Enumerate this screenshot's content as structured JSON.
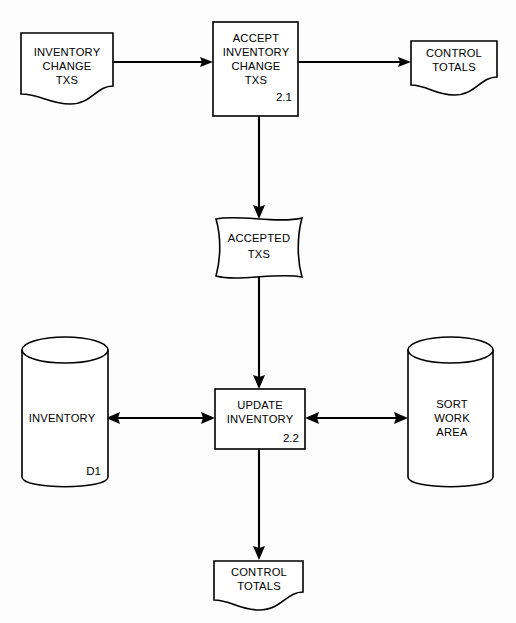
{
  "diagram": {
    "type": "data-flow-diagram",
    "background_color": "#fdfdfd",
    "line_color": "#000000",
    "fill_color": "#ffffff"
  },
  "nodes": {
    "inventory_change_txs": {
      "shape": "document",
      "line1": "INVENTORY",
      "line2": "CHANGE",
      "line3": "TXS"
    },
    "accept_process": {
      "shape": "process-box",
      "line1": "ACCEPT",
      "line2": "INVENTORY",
      "line3": "CHANGE",
      "line4": "TXS",
      "number": "2.1"
    },
    "control_totals_top": {
      "shape": "document",
      "line1": "CONTROL",
      "line2": "TOTALS"
    },
    "accepted_txs": {
      "shape": "magnetic-tape",
      "line1": "ACCEPTED",
      "line2": "TXS"
    },
    "inventory_store": {
      "shape": "cylinder",
      "line1": "INVENTORY",
      "number": "D1"
    },
    "update_process": {
      "shape": "process-box",
      "line1": "UPDATE",
      "line2": "INVENTORY",
      "number": "2.2"
    },
    "sort_work_area": {
      "shape": "cylinder",
      "line1": "SORT",
      "line2": "WORK",
      "line3": "AREA"
    },
    "control_totals_bottom": {
      "shape": "document",
      "line1": "CONTROL",
      "line2": "TOTALS"
    }
  },
  "flows": [
    {
      "name": "inventory-change-to-accept",
      "direction": "right",
      "from": "inventory_change_txs",
      "to": "accept_process"
    },
    {
      "name": "accept-to-control-totals",
      "direction": "right",
      "from": "accept_process",
      "to": "control_totals_top"
    },
    {
      "name": "accept-to-accepted-txs",
      "direction": "down",
      "from": "accept_process",
      "to": "accepted_txs"
    },
    {
      "name": "accepted-txs-to-update",
      "direction": "down",
      "from": "accepted_txs",
      "to": "update_process"
    },
    {
      "name": "inventory-store-update-bidirectional",
      "direction": "bidirectional",
      "from": "inventory_store",
      "to": "update_process"
    },
    {
      "name": "update-sort-work-area-bidirectional",
      "direction": "bidirectional",
      "from": "update_process",
      "to": "sort_work_area"
    },
    {
      "name": "update-to-control-totals",
      "direction": "down",
      "from": "update_process",
      "to": "control_totals_bottom"
    }
  ]
}
